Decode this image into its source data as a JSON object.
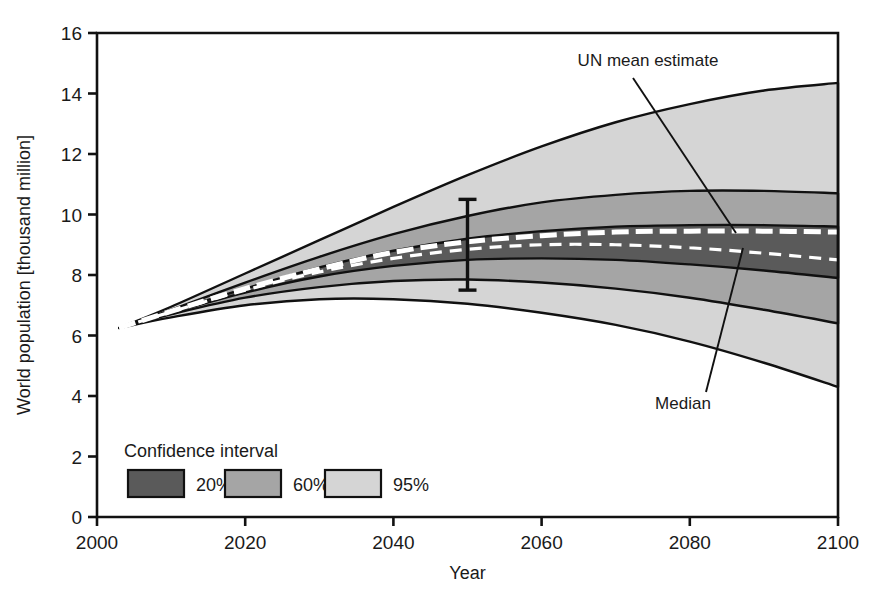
{
  "chart_data": {
    "type": "area",
    "title": "",
    "xlabel": "Year",
    "ylabel": "World population [thousand million]",
    "xlim": [
      2000,
      2100
    ],
    "ylim": [
      0,
      16
    ],
    "xticks": [
      "2000",
      "2020",
      "2040",
      "2060",
      "2080",
      "2100"
    ],
    "yticks": [
      "0",
      "2",
      "4",
      "6",
      "8",
      "10",
      "12",
      "14",
      "16"
    ],
    "grid": false,
    "x": [
      2003,
      2010,
      2020,
      2030,
      2040,
      2050,
      2060,
      2070,
      2080,
      2090,
      2100
    ],
    "series": [
      {
        "name": "95% upper",
        "values": [
          6.25,
          6.95,
          8.05,
          9.15,
          10.25,
          11.3,
          12.25,
          13.05,
          13.65,
          14.1,
          14.35
        ]
      },
      {
        "name": "60% upper",
        "values": [
          6.25,
          6.85,
          7.75,
          8.6,
          9.35,
          9.95,
          10.4,
          10.65,
          10.78,
          10.78,
          10.7
        ]
      },
      {
        "name": "20% upper",
        "values": [
          6.25,
          6.8,
          7.55,
          8.25,
          8.8,
          9.2,
          9.45,
          9.6,
          9.65,
          9.65,
          9.6
        ]
      },
      {
        "name": "UN mean estimate",
        "values": [
          6.25,
          6.8,
          7.55,
          8.2,
          8.75,
          9.1,
          9.3,
          9.42,
          9.45,
          9.45,
          9.42
        ]
      },
      {
        "name": "Median",
        "values": [
          6.25,
          6.78,
          7.5,
          8.1,
          8.55,
          8.85,
          9.0,
          9.0,
          8.9,
          8.72,
          8.5
        ]
      },
      {
        "name": "20% lower",
        "values": [
          6.25,
          6.75,
          7.42,
          7.95,
          8.3,
          8.5,
          8.55,
          8.5,
          8.35,
          8.15,
          7.9
        ]
      },
      {
        "name": "60% lower",
        "values": [
          6.25,
          6.7,
          7.25,
          7.6,
          7.8,
          7.85,
          7.75,
          7.55,
          7.25,
          6.85,
          6.4
        ]
      },
      {
        "name": "95% lower",
        "values": [
          6.25,
          6.6,
          7.0,
          7.2,
          7.2,
          7.05,
          6.75,
          6.35,
          5.8,
          5.1,
          4.3
        ]
      }
    ],
    "error_bar": {
      "x": 2050,
      "low": 7.5,
      "high": 10.5
    },
    "annotations": [
      {
        "name": "un-mean-estimate",
        "label": "UN mean estimate"
      },
      {
        "name": "median",
        "label": "Median"
      }
    ]
  },
  "legend": {
    "title": "Confidence interval",
    "position": "inside-bottom-left",
    "entries": [
      {
        "label": "20%",
        "color": "#5a5a5a"
      },
      {
        "label": "60%",
        "color": "#a5a5a5"
      },
      {
        "label": "95%",
        "color": "#d5d5d5"
      }
    ]
  },
  "colors": {
    "band_20": "#5a5a5a",
    "band_60": "#a5a5a5",
    "band_95": "#d5d5d5",
    "line": "#111111",
    "median_line": "#ffffff",
    "background": "#ffffff"
  }
}
